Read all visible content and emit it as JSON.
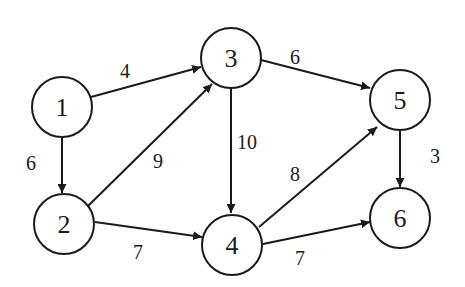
{
  "diagram": {
    "type": "directed weighted graph",
    "nodes": [
      {
        "id": "1",
        "label": "1",
        "x": 62,
        "y": 107
      },
      {
        "id": "2",
        "label": "2",
        "x": 64,
        "y": 224
      },
      {
        "id": "3",
        "label": "3",
        "x": 231,
        "y": 58
      },
      {
        "id": "4",
        "label": "4",
        "x": 232,
        "y": 245
      },
      {
        "id": "5",
        "label": "5",
        "x": 400,
        "y": 100
      },
      {
        "id": "6",
        "label": "6",
        "x": 400,
        "y": 218
      }
    ],
    "edges": [
      {
        "from": "1",
        "to": "3",
        "weight": "4"
      },
      {
        "from": "1",
        "to": "2",
        "weight": "6"
      },
      {
        "from": "2",
        "to": "3",
        "weight": "9"
      },
      {
        "from": "2",
        "to": "4",
        "weight": "7"
      },
      {
        "from": "3",
        "to": "5",
        "weight": "6"
      },
      {
        "from": "3",
        "to": "4",
        "weight": "10"
      },
      {
        "from": "4",
        "to": "5",
        "weight": "8"
      },
      {
        "from": "4",
        "to": "6",
        "weight": "7"
      },
      {
        "from": "5",
        "to": "6",
        "weight": "3"
      }
    ]
  }
}
